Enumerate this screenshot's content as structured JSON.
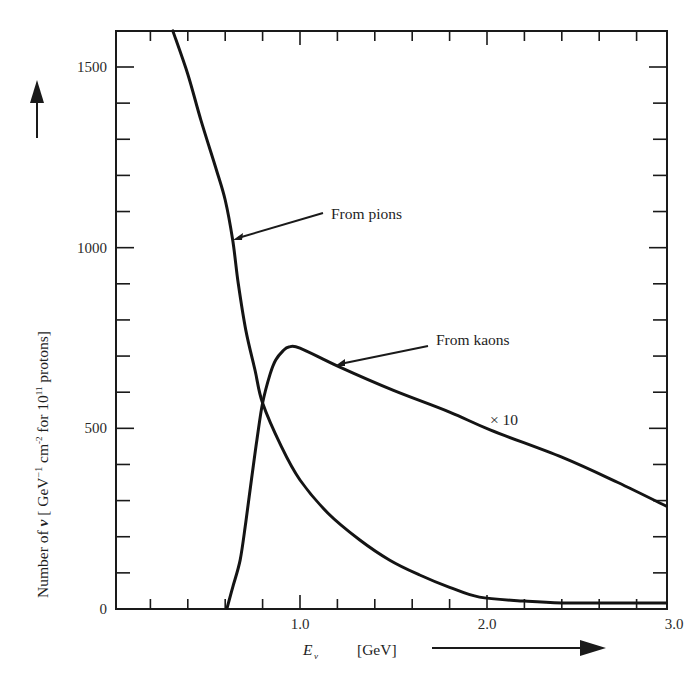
{
  "chart_data": {
    "type": "line",
    "title": "",
    "xlabel": "E_ν [GeV]",
    "xlabel_main": "E",
    "xlabel_sub": "ν",
    "xlabel_unit": "[GeV]",
    "ylabel": "Number of ν [GeV⁻¹ cm⁻² for 10¹¹ protons]",
    "ylabel_parts": {
      "prefix": "Number of ",
      "nu": "ν",
      "bracket_open": " [ GeV",
      "exp1": "−1",
      "cm": "  cm",
      "exp2": "-2",
      "for": " for 10",
      "exp3": "11",
      "suffix": " protons]"
    },
    "xlim": [
      0,
      3.0
    ],
    "ylim": [
      0,
      1600
    ],
    "x_ticks": [
      {
        "value": 1.0,
        "label": "1.0"
      },
      {
        "value": 2.0,
        "label": "2.0"
      },
      {
        "value": 3.0,
        "label": "3.0"
      }
    ],
    "y_ticks": [
      {
        "value": 0,
        "label": "0"
      },
      {
        "value": 500,
        "label": "500"
      },
      {
        "value": 1000,
        "label": "1000"
      },
      {
        "value": 1500,
        "label": "1500"
      }
    ],
    "x_minor_step": 0.2,
    "y_minor_step": 100,
    "grid": false,
    "legend": null,
    "series": [
      {
        "name": "From pions",
        "x": [
          0.32,
          0.4,
          0.47,
          0.55,
          0.6,
          0.64,
          0.67,
          0.71,
          0.76,
          0.8,
          0.9,
          1.0,
          1.15,
          1.32,
          1.48,
          1.64,
          1.8,
          1.96,
          2.2,
          2.4,
          2.7,
          2.96
        ],
        "y": [
          1600,
          1480,
          1353,
          1220,
          1132,
          1021,
          900,
          772,
          660,
          570,
          450,
          357,
          265,
          191,
          135,
          94,
          60,
          33,
          22,
          17,
          17,
          17
        ]
      },
      {
        "name": "From kaons (×10)",
        "x": [
          0.61,
          0.64,
          0.68,
          0.71,
          0.74,
          0.77,
          0.8,
          0.84,
          0.87,
          0.91,
          0.94,
          1.0,
          1.21,
          1.5,
          1.8,
          2.02,
          2.4,
          2.7,
          2.96
        ],
        "y": [
          0,
          60,
          136,
          240,
          357,
          470,
          570,
          650,
          689,
          715,
          725,
          722,
          670,
          605,
          545,
          495,
          420,
          350,
          285
        ]
      }
    ],
    "annotations": [
      {
        "text": "From pions",
        "points_to": {
          "x": 0.64,
          "y": 1021
        }
      },
      {
        "text": "From kaons",
        "points_to": {
          "x": 1.18,
          "y": 675
        }
      },
      {
        "text": "× 10",
        "near": {
          "x": 2.05,
          "y": 510
        }
      }
    ],
    "axis_arrows": {
      "x": "right",
      "y": "up"
    }
  }
}
